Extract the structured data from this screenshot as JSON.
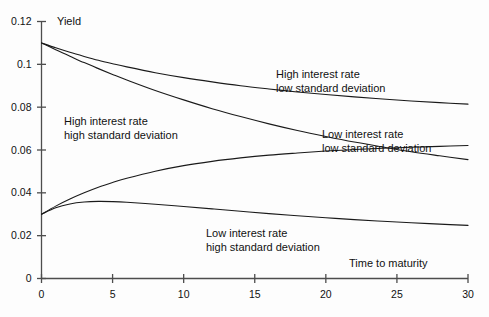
{
  "chart_data": {
    "type": "line",
    "title": "",
    "xlabel": "Time to maturity",
    "ylabel": "Yield",
    "xlim": [
      0,
      30
    ],
    "ylim": [
      0,
      0.12
    ],
    "grid": false,
    "legend_position": "inline-annotations",
    "xticks": [
      0,
      5,
      10,
      15,
      20,
      25,
      30
    ],
    "xticklabels": [
      "0",
      "5",
      "10",
      "15",
      "20",
      "25",
      "30"
    ],
    "yticks": [
      0,
      0.02,
      0.04,
      0.06,
      0.08,
      0.1,
      0.12
    ],
    "yticklabels": [
      "0",
      "0.02",
      "0.04",
      "0.06",
      "0.08",
      "0.1",
      "0.12"
    ],
    "x": [
      0,
      1,
      2,
      3,
      4,
      5,
      6,
      8,
      10,
      12,
      14,
      16,
      18,
      20,
      22,
      24,
      26,
      28,
      30
    ],
    "series": [
      {
        "name": "High interest rate low standard deviation",
        "values": [
          0.11,
          0.1077,
          0.1056,
          0.1037,
          0.1019,
          0.1003,
          0.0988,
          0.0961,
          0.0938,
          0.0918,
          0.09,
          0.0885,
          0.0871,
          0.0859,
          0.0848,
          0.0838,
          0.0829,
          0.0821,
          0.0814
        ]
      },
      {
        "name": "High interest rate high standard deviation",
        "values": [
          0.11,
          0.1068,
          0.1038,
          0.1008,
          0.098,
          0.0953,
          0.0927,
          0.0878,
          0.0834,
          0.0793,
          0.0756,
          0.0722,
          0.0691,
          0.0663,
          0.0637,
          0.0614,
          0.0592,
          0.0573,
          0.0555
        ]
      },
      {
        "name": "Low interest rate low standard deviation",
        "values": [
          0.03,
          0.0338,
          0.0371,
          0.04,
          0.0426,
          0.0448,
          0.0468,
          0.0501,
          0.0527,
          0.0547,
          0.0563,
          0.0576,
          0.0586,
          0.0595,
          0.0602,
          0.0608,
          0.0613,
          0.0617,
          0.0621
        ]
      },
      {
        "name": "Low interest rate high standard deviation",
        "values": [
          0.03,
          0.033,
          0.0348,
          0.0357,
          0.036,
          0.0359,
          0.0356,
          0.0347,
          0.0336,
          0.0325,
          0.0314,
          0.0303,
          0.0293,
          0.0284,
          0.0275,
          0.0267,
          0.026,
          0.0254,
          0.0248
        ]
      }
    ],
    "annotations": [
      {
        "id": "high-rate-high-sd",
        "line1": "High interest rate",
        "line2": "high standard deviation"
      },
      {
        "id": "high-rate-low-sd",
        "line1": "High interest rate",
        "line2": "low standard deviation"
      },
      {
        "id": "low-rate-low-sd",
        "line1": "Low interest rate",
        "line2": "low standard deviation"
      },
      {
        "id": "low-rate-high-sd",
        "line1": "Low interest rate",
        "line2": "high standard deviation"
      }
    ],
    "colors": {
      "axis": "#4d4d4d",
      "curve": "#1a1a1a",
      "background": "#fdfdfd",
      "text": "#111111"
    }
  }
}
